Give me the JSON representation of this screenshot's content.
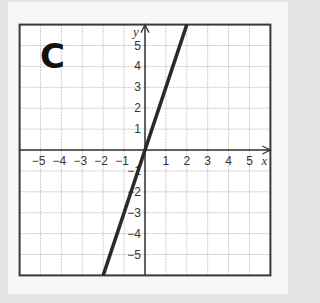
{
  "panel": {
    "label": "C"
  },
  "colors": {
    "grid": "#c8c8c8",
    "axis": "#333333",
    "line": "#2a2a2a",
    "frame": "#3a3a3a",
    "background": "#ffffff"
  },
  "chart_data": {
    "type": "line",
    "title": "C",
    "xlabel": "x",
    "ylabel": "y",
    "xlim": [
      -6,
      6
    ],
    "ylim": [
      -6,
      6
    ],
    "grid": true,
    "x_ticks": [
      -5,
      -4,
      -3,
      -2,
      -1,
      1,
      2,
      3,
      4,
      5
    ],
    "y_ticks": [
      -5,
      -4,
      -3,
      -2,
      -1,
      1,
      2,
      3,
      4,
      5
    ],
    "series": [
      {
        "name": "line",
        "equation": "y = 3x",
        "slope": 3,
        "intercept": 0,
        "x": [
          -2,
          2
        ],
        "y": [
          -6,
          6
        ]
      }
    ]
  }
}
